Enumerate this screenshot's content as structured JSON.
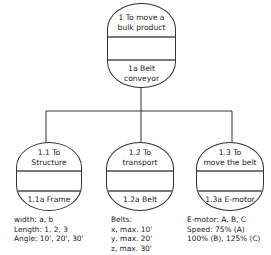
{
  "root": {
    "function": "1 To move a bulk product",
    "function_lines": [
      "1 To move a",
      "bulk product"
    ],
    "solution": "1a Belt conveyor",
    "solution_lines": [
      "1a Belt",
      "conveyor"
    ]
  },
  "children": [
    {
      "function_lines": [
        "1.1 To",
        "Structure"
      ],
      "solution": "1.1a Frame",
      "notes": [
        "width: a, b",
        "Length: 1, 2, 3",
        "Angle: 10', 20', 30'"
      ]
    },
    {
      "function_lines": [
        "1.2 To",
        "transport"
      ],
      "solution": "1.2a Belt",
      "notes": [
        "Belts:",
        "x, max. 10'",
        "y, max. 20'",
        "z, max. 30'"
      ]
    },
    {
      "function_lines": [
        "1.3 To",
        "move the belt"
      ],
      "solution": "1.3a E-motor",
      "notes": [
        "E-motor: A, B, C",
        "Speed: 75% (A)",
        "100% (B), 125% (C)"
      ]
    }
  ],
  "colors": {
    "stroke": "#333333",
    "divider": "#777777",
    "text": "#222222"
  }
}
